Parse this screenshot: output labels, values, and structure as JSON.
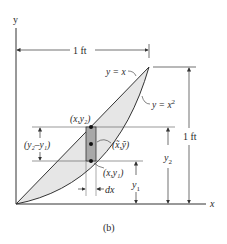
{
  "figure": {
    "caption": "(b)",
    "axes": {
      "x_label": "x",
      "y_label": "y"
    },
    "curves": [
      {
        "label": "y = x",
        "equation_lhs": "y = ",
        "equation_rhs": "x"
      },
      {
        "label": "y = x²",
        "equation_lhs": "y = ",
        "equation_rhs": "x",
        "exponent": "2"
      }
    ],
    "dimensions": {
      "width": "1 ft",
      "height": "1 ft",
      "y2": "y",
      "y2_sub": "2",
      "y1": "y",
      "y1_sub": "1",
      "dx": "dx",
      "diff_label": "(y₂–y₁)"
    },
    "points": {
      "top": "(x,y₂)",
      "bottom": "(x,y₁)",
      "centroid": "(x̃,ỹ)"
    },
    "colors": {
      "region_fill": "#e6e6e6",
      "element_fill": "#a8a8a8",
      "line": "#333333"
    }
  }
}
